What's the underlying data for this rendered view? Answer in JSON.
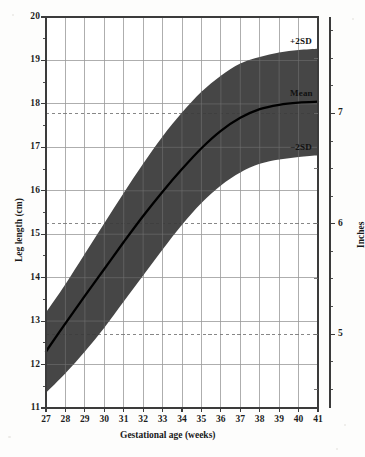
{
  "chart_data": {
    "type": "area",
    "title": "",
    "xlabel": "Gestational age (weeks)",
    "ylabel": "Leg length (cm)",
    "y2label": "Inches",
    "xlim": [
      27,
      41
    ],
    "ylim": [
      11,
      20
    ],
    "y2lim": [
      4.33,
      7.87
    ],
    "grid": true,
    "legend_position": "right-inline-annotations",
    "x": [
      27,
      28,
      29,
      30,
      31,
      32,
      33,
      34,
      35,
      36,
      37,
      38,
      39,
      40,
      41
    ],
    "xticklabels": [
      "27",
      "28",
      "29",
      "30",
      "31",
      "32",
      "33",
      "34",
      "35",
      "36",
      "37",
      "38",
      "39",
      "40",
      "41"
    ],
    "yticklabels": [
      "11",
      "12",
      "13",
      "14",
      "15",
      "16",
      "17",
      "18",
      "19",
      "20"
    ],
    "y2ticklabels": [
      "5",
      "6",
      "7"
    ],
    "y2tickvalues_cm": [
      12.7,
      15.24,
      17.78
    ],
    "series": [
      {
        "name": "+2SD",
        "label": "+2SD",
        "values": [
          13.2,
          13.85,
          14.55,
          15.25,
          15.95,
          16.62,
          17.25,
          17.8,
          18.28,
          18.65,
          18.93,
          19.08,
          19.18,
          19.24,
          19.27
        ]
      },
      {
        "name": "Mean",
        "label": "Mean",
        "values": [
          12.3,
          12.95,
          13.58,
          14.2,
          14.82,
          15.42,
          15.98,
          16.5,
          16.98,
          17.38,
          17.68,
          17.88,
          17.98,
          18.03,
          18.05
        ]
      },
      {
        "name": "-2SD",
        "label": "−2SD",
        "values": [
          11.35,
          11.8,
          12.3,
          12.85,
          13.45,
          14.05,
          14.65,
          15.22,
          15.72,
          16.12,
          16.42,
          16.62,
          16.72,
          16.78,
          16.82
        ]
      }
    ],
    "band": {
      "upper": "+2SD",
      "lower": "-2SD",
      "fill_color": "#3a3a3a"
    },
    "mean_line_color": "#000000",
    "grid_color": "#9a9a9a",
    "dashed_inch_line_color": "#7a7a7a",
    "axis_color": "#444444"
  },
  "annotations": {
    "plus_2sd": "+2SD",
    "mean": "Mean",
    "minus_2sd": "−2SD"
  },
  "axes": {
    "x_title": "Gestational age (weeks)",
    "y_title": "Leg length (cm)",
    "y2_title": "Inches"
  }
}
